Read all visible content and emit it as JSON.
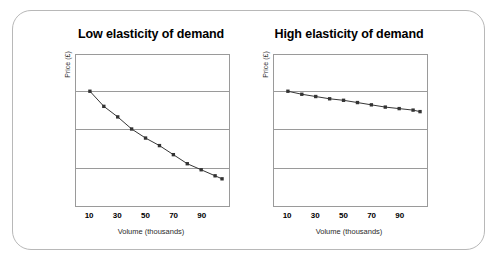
{
  "figure": {
    "frame_border_color": "#b8b8b8",
    "background_color": "#ffffff"
  },
  "charts": [
    {
      "id": "low-elasticity",
      "chart_data": {
        "type": "line",
        "title": "Low elasticity of demand",
        "xlabel": "Volume (thousands)",
        "ylabel": "Price (£)",
        "grid": true,
        "legend": "none",
        "marker": "square",
        "line_color": "#333333",
        "marker_color": "#333333",
        "xlim": [
          0,
          110
        ],
        "ylim": [
          0,
          100
        ],
        "xticks": [
          "10",
          "30",
          "50",
          "70",
          "90"
        ],
        "xtick_values": [
          10,
          30,
          50,
          70,
          90
        ],
        "yticks": [],
        "x": [
          10,
          20,
          30,
          40,
          50,
          60,
          70,
          80,
          90,
          100,
          105
        ],
        "values": [
          76,
          66,
          59,
          51,
          45,
          40,
          34,
          28,
          24,
          20,
          18
        ]
      }
    },
    {
      "id": "high-elasticity",
      "chart_data": {
        "type": "line",
        "title": "High elasticity of demand",
        "xlabel": "Volume (thousands)",
        "ylabel": "Price (£)",
        "grid": true,
        "legend": "none",
        "marker": "square",
        "line_color": "#333333",
        "marker_color": "#333333",
        "xlim": [
          0,
          110
        ],
        "ylim": [
          0,
          100
        ],
        "xticks": [
          "10",
          "30",
          "50",
          "70",
          "90"
        ],
        "xtick_values": [
          10,
          30,
          50,
          70,
          90
        ],
        "yticks": [],
        "x": [
          10,
          20,
          30,
          40,
          50,
          60,
          70,
          80,
          90,
          100,
          105
        ],
        "values": [
          76,
          74,
          72.5,
          71,
          70,
          68.5,
          67,
          65.5,
          64.5,
          63.5,
          62.5
        ]
      }
    }
  ]
}
